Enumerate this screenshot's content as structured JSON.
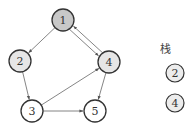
{
  "graph": {
    "nodes": [
      {
        "id": "1",
        "label": "1",
        "x": 63,
        "y": 20,
        "fill": "#c8c8c8"
      },
      {
        "id": "2",
        "label": "2",
        "x": 20,
        "y": 61,
        "fill": "#e6e6e6"
      },
      {
        "id": "3",
        "label": "3",
        "x": 32,
        "y": 111,
        "fill": "#ffffff"
      },
      {
        "id": "4",
        "label": "4",
        "x": 109,
        "y": 62,
        "fill": "#e6e6e6"
      },
      {
        "id": "5",
        "label": "5",
        "x": 95,
        "y": 111,
        "fill": "#ffffff"
      }
    ],
    "edges": [
      {
        "from": "1",
        "to": "2"
      },
      {
        "from": "1",
        "to": "4"
      },
      {
        "from": "4",
        "to": "1"
      },
      {
        "from": "2",
        "to": "3"
      },
      {
        "from": "3",
        "to": "4"
      },
      {
        "from": "3",
        "to": "5"
      },
      {
        "from": "4",
        "to": "5"
      }
    ]
  },
  "stack": {
    "title": "栈",
    "items": [
      {
        "label": "2",
        "x": 175,
        "y": 73
      },
      {
        "label": "4",
        "x": 175,
        "y": 103
      }
    ]
  }
}
